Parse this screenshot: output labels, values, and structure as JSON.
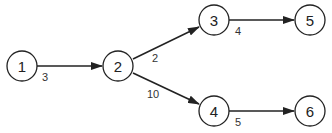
{
  "diagram": {
    "type": "directed-weighted-graph",
    "nodes": [
      {
        "id": "1",
        "label": "1"
      },
      {
        "id": "2",
        "label": "2"
      },
      {
        "id": "3",
        "label": "3"
      },
      {
        "id": "4",
        "label": "4"
      },
      {
        "id": "5",
        "label": "5"
      },
      {
        "id": "6",
        "label": "6"
      }
    ],
    "edges": [
      {
        "from": "1",
        "to": "2",
        "weight": "3"
      },
      {
        "from": "2",
        "to": "3",
        "weight": "2"
      },
      {
        "from": "2",
        "to": "4",
        "weight": "10"
      },
      {
        "from": "3",
        "to": "5",
        "weight": "4"
      },
      {
        "from": "4",
        "to": "6",
        "weight": "5"
      }
    ]
  }
}
